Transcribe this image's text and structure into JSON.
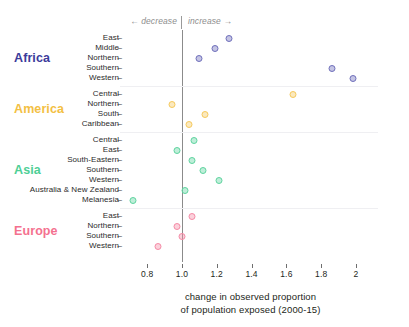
{
  "annotations": {
    "decrease": "← decrease",
    "increase": "increase →"
  },
  "axis": {
    "title_line1": "change in observed proportion",
    "title_line2": "of population exposed (2000-15)",
    "ticks": [
      "0.8",
      "1.0",
      "1.2",
      "1.4",
      "1.6",
      "1.8",
      "2"
    ],
    "dash": "–"
  },
  "colors": {
    "africa": "#3b3b9b",
    "america": "#f3c043",
    "asia": "#4ecf96",
    "europe": "#f4718f",
    "zero_line": "#8b8b8b",
    "separator": "#efeff2",
    "text": "#231f20"
  },
  "chart_data": {
    "type": "scatter",
    "title": "",
    "subtitle": "",
    "xlabel": "change in observed proportion of population exposed (2000-15)",
    "ylabel": "",
    "xlim": [
      0.72,
      2.04
    ],
    "xticks": [
      0.8,
      1.0,
      1.2,
      1.4,
      1.6,
      1.8,
      2.0
    ],
    "reference_line_x": 1.0,
    "grid": false,
    "legend_position": "left-inline-group-labels",
    "annotations": [
      "← decrease",
      "increase →"
    ],
    "groups": [
      {
        "name": "Africa",
        "color": "#3b3b9b",
        "marker_color": "#6f6fbb",
        "points": [
          {
            "label": "East",
            "value": 1.27
          },
          {
            "label": "Middle",
            "value": 1.19
          },
          {
            "label": "Northern",
            "value": 1.1
          },
          {
            "label": "Southern",
            "value": 1.86
          },
          {
            "label": "Western",
            "value": 1.98
          }
        ]
      },
      {
        "name": "America",
        "color": "#f3c043",
        "marker_color": "#f6c95c",
        "points": [
          {
            "label": "Central",
            "value": 1.64
          },
          {
            "label": "Northern",
            "value": 0.94
          },
          {
            "label": "South",
            "value": 1.13
          },
          {
            "label": "Caribbean",
            "value": 1.04
          }
        ]
      },
      {
        "name": "Asia",
        "color": "#4ecf96",
        "marker_color": "#5fd49f",
        "points": [
          {
            "label": "Central",
            "value": 1.07
          },
          {
            "label": "East",
            "value": 0.97
          },
          {
            "label": "South-Eastern",
            "value": 1.06
          },
          {
            "label": "Southern",
            "value": 1.12
          },
          {
            "label": "Western",
            "value": 1.21
          },
          {
            "label": "Australia & New Zealand",
            "value": 1.02
          },
          {
            "label": "Melanesia",
            "value": 0.72
          }
        ]
      },
      {
        "name": "Europe",
        "color": "#f4718f",
        "marker_color": "#f58ba6",
        "points": [
          {
            "label": "East",
            "value": 1.06
          },
          {
            "label": "Northern",
            "value": 0.97
          },
          {
            "label": "Southern",
            "value": 1.0
          },
          {
            "label": "Western",
            "value": 0.86
          }
        ]
      }
    ]
  }
}
